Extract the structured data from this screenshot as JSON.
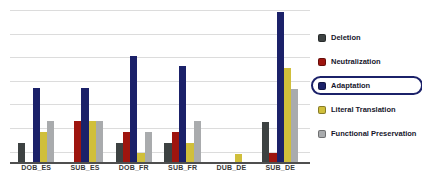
{
  "chart_data": {
    "type": "bar",
    "title": "",
    "categories": [
      "DOB_ES",
      "SUB_ES",
      "DOB_FR",
      "SUB_FR",
      "DUB_DE",
      "SUB_DE"
    ],
    "series": [
      {
        "name": "Deletion",
        "color": "#3d4242",
        "values": [
          12.5,
          0,
          12.5,
          12.5,
          0,
          26.5
        ]
      },
      {
        "name": "Neutralization",
        "color": "#9e150f",
        "values": [
          0,
          27,
          20,
          20,
          0,
          6
        ]
      },
      {
        "name": "Adaptation",
        "color": "#1b2169",
        "values": [
          48.5,
          48.5,
          70,
          63,
          0,
          98.5
        ]
      },
      {
        "name": "Literal Translation",
        "color": "#d0bf3b",
        "values": [
          19.5,
          27,
          6,
          12.5,
          5,
          62
        ]
      },
      {
        "name": "Functional Preservation",
        "color": "#a9abad",
        "values": [
          27,
          27,
          19.5,
          27,
          0,
          48
        ]
      }
    ],
    "value_units": "relative bar height, percent of plot area (no y-axis tick labels visible)",
    "ylim": [
      0,
      100
    ],
    "grid": "horizontal",
    "gridline_count": 7,
    "y_tick_labels_visible": false,
    "gridline_color": "#dcdcdc",
    "axis_color": "#4f4f4f",
    "legend": {
      "position": "right",
      "highlighted_entry": "Adaptation",
      "highlight_border_color": "#1b2169"
    }
  }
}
